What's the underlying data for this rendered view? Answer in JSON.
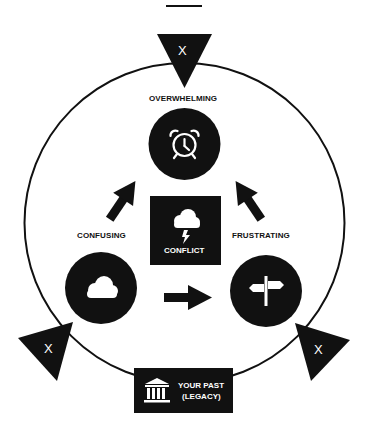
{
  "diagram": {
    "top_rule": true,
    "markers": {
      "top": "X",
      "left": "X",
      "right": "X"
    },
    "nodes": {
      "overwhelming": {
        "label": "OVERWHELMING",
        "icon": "alarm-clock-icon"
      },
      "confusing": {
        "label": "CONFUSING",
        "icon": "cloud-icon"
      },
      "frustrating": {
        "label": "FRUSTRATING",
        "icon": "signpost-icon"
      },
      "conflict": {
        "label": "CONFLICT",
        "icon": "storm-cloud-icon"
      },
      "legacy": {
        "line1": "YOUR PAST",
        "line2": "(LEGACY)",
        "icon": "museum-building-icon"
      }
    },
    "flow": [
      {
        "from": "CONFUSING",
        "to": "FRUSTRATING"
      },
      {
        "from": "CONFUSING",
        "to": "OVERWHELMING"
      },
      {
        "from": "FRUSTRATING",
        "to": "OVERWHELMING"
      }
    ],
    "colors": {
      "ink": "#111111",
      "background": "#ffffff",
      "icon_fill": "#ffffff"
    }
  }
}
